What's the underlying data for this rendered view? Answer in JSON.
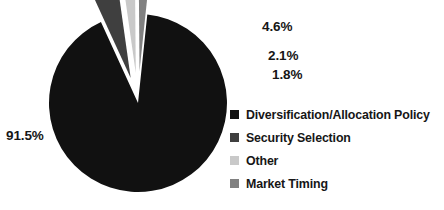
{
  "chart_data": {
    "type": "pie",
    "title": "",
    "subtitle": "",
    "xlabel": "",
    "ylabel": "",
    "legend_position": "right",
    "grid": false,
    "exploded": true,
    "categories": [
      "Diversification/Allocation Policy",
      "Security Selection",
      "Other",
      "Market Timing"
    ],
    "values": [
      91.5,
      4.6,
      2.1,
      1.8
    ],
    "labels": [
      "91.5%",
      "4.6%",
      "2.1%",
      "1.8%"
    ],
    "colors": [
      "#111111",
      "#3f3f3f",
      "#c9c9c9",
      "#808080"
    ],
    "slices": [
      {
        "name": "Diversification/Allocation Policy",
        "value": 91.5,
        "label": "91.5%",
        "color": "#111111"
      },
      {
        "name": "Security Selection",
        "value": 4.6,
        "label": "4.6%",
        "color": "#3f3f3f"
      },
      {
        "name": "Other",
        "value": 2.1,
        "label": "2.1%",
        "color": "#c9c9c9"
      },
      {
        "name": "Market Timing",
        "value": 1.8,
        "label": "1.8%",
        "color": "#808080"
      }
    ]
  },
  "legend": {
    "items": [
      {
        "label": "Diversification/Allocation Policy",
        "color": "#111111"
      },
      {
        "label": "Security Selection",
        "color": "#3f3f3f"
      },
      {
        "label": "Other",
        "color": "#c9c9c9"
      },
      {
        "label": "Market Timing",
        "color": "#808080"
      }
    ]
  }
}
